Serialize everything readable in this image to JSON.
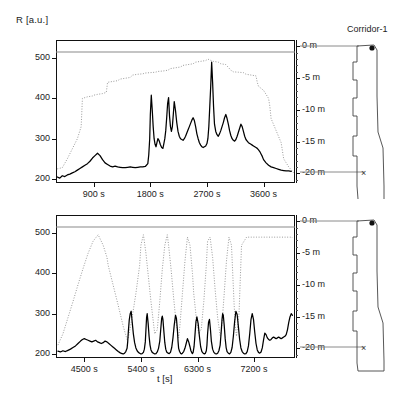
{
  "figure": {
    "y_axis_label": "R [a.u.]",
    "x_axis_label": "t [s]",
    "depth_unit": "m",
    "corridor_title": "Corridor-1",
    "colors": {
      "signal": "#000000",
      "depth_profile": "#9a9a9a",
      "frame": "#111111",
      "guide_line": "#8a8a8a"
    }
  },
  "chart_data": [
    {
      "type": "line",
      "title": "Corridor-1 upper run",
      "xlabel": "t [s]",
      "ylabel": "R [a.u.]",
      "xlim": [
        300,
        4100
      ],
      "ylim": [
        190,
        545
      ],
      "xticks": [
        900,
        1800,
        2700,
        3600
      ],
      "xticklabels": [
        "900 s",
        "1800 s",
        "2700 s",
        "3600 s"
      ],
      "yticks": [
        200,
        300,
        400,
        500
      ],
      "yticklabels": [
        "200",
        "300",
        "400",
        "500"
      ],
      "depth_axis": {
        "ticks": [
          0,
          -5,
          -10,
          -15,
          -20
        ],
        "ticklabels": [
          "0 m",
          "-5 m",
          "-10 m",
          "-15 m",
          "-20 m"
        ],
        "range": [
          -21.5,
          1.0
        ]
      },
      "grid": false,
      "legend": "none",
      "series": [
        {
          "name": "R signal",
          "style": "solid-black",
          "x": [
            320,
            360,
            400,
            440,
            480,
            520,
            560,
            600,
            640,
            680,
            720,
            760,
            800,
            840,
            880,
            920,
            960,
            1000,
            1040,
            1080,
            1120,
            1160,
            1200,
            1240,
            1280,
            1320,
            1360,
            1400,
            1440,
            1480,
            1520,
            1560,
            1600,
            1640,
            1680,
            1720,
            1760,
            1775,
            1790,
            1800,
            1815,
            1830,
            1845,
            1860,
            1875,
            1890,
            1905,
            1920,
            1940,
            1960,
            1980,
            2000,
            2015,
            2030,
            2045,
            2060,
            2075,
            2090,
            2105,
            2120,
            2135,
            2150,
            2165,
            2180,
            2200,
            2220,
            2240,
            2260,
            2280,
            2300,
            2320,
            2340,
            2360,
            2380,
            2400,
            2420,
            2440,
            2460,
            2480,
            2500,
            2520,
            2540,
            2560,
            2580,
            2600,
            2620,
            2640,
            2660,
            2680,
            2700,
            2715,
            2730,
            2745,
            2760,
            2775,
            2790,
            2805,
            2820,
            2840,
            2860,
            2880,
            2900,
            2920,
            2940,
            2960,
            2980,
            3000,
            3020,
            3040,
            3060,
            3080,
            3100,
            3120,
            3140,
            3160,
            3180,
            3200,
            3220,
            3240,
            3260,
            3280,
            3300,
            3320,
            3340,
            3360,
            3380,
            3400,
            3420,
            3440,
            3460,
            3480,
            3500,
            3520,
            3540,
            3560,
            3580,
            3600,
            3640,
            3680,
            3720,
            3760,
            3800,
            3840,
            3880,
            3920,
            3960,
            4000,
            4040,
            4080
          ],
          "y": [
            205,
            202,
            208,
            206,
            210,
            212,
            215,
            218,
            222,
            226,
            230,
            234,
            238,
            244,
            252,
            258,
            264,
            258,
            248,
            240,
            236,
            232,
            230,
            232,
            230,
            229,
            228,
            228,
            229,
            230,
            229,
            228,
            229,
            230,
            230,
            231,
            238,
            260,
            300,
            360,
            408,
            372,
            330,
            300,
            286,
            280,
            290,
            300,
            295,
            285,
            278,
            276,
            288,
            300,
            320,
            352,
            388,
            402,
            356,
            330,
            318,
            330,
            360,
            392,
            370,
            340,
            318,
            306,
            300,
            298,
            296,
            300,
            306,
            314,
            322,
            330,
            338,
            346,
            352,
            345,
            330,
            312,
            300,
            290,
            284,
            280,
            278,
            280,
            282,
            288,
            300,
            330,
            380,
            430,
            490,
            440,
            380,
            336,
            318,
            310,
            306,
            312,
            320,
            330,
            340,
            352,
            360,
            350,
            336,
            320,
            308,
            300,
            296,
            294,
            298,
            306,
            316,
            326,
            336,
            330,
            318,
            306,
            298,
            294,
            290,
            288,
            286,
            284,
            282,
            280,
            278,
            276,
            272,
            268,
            262,
            256,
            248,
            240,
            234,
            230,
            228,
            226,
            224,
            222,
            221,
            220,
            220,
            219
          ]
        },
        {
          "name": "Depth profile",
          "style": "dotted-gray",
          "x": [
            320,
            400,
            480,
            560,
            640,
            700,
            720,
            800,
            880,
            900,
            960,
            1040,
            1100,
            1120,
            1200,
            1280,
            1300,
            1320,
            1400,
            1480,
            1500,
            1520,
            1600,
            1680,
            1700,
            1720,
            1800,
            1880,
            1900,
            1920,
            2000,
            2080,
            2100,
            2120,
            2200,
            2280,
            2300,
            2320,
            2400,
            2480,
            2500,
            2520,
            2600,
            2680,
            2700,
            2720,
            2800,
            2880,
            2900,
            2920,
            3000,
            3080,
            3100,
            3120,
            3200,
            3280,
            3300,
            3320,
            3400,
            3480,
            3500,
            3520,
            3600,
            3680,
            3700,
            3720,
            3800,
            3880,
            3900,
            3920,
            4000,
            4080
          ],
          "y": [
            225,
            228,
            250,
            275,
            300,
            330,
            400,
            404,
            406,
            408,
            410,
            412,
            415,
            440,
            442,
            444,
            446,
            448,
            450,
            452,
            455,
            458,
            460,
            461,
            462,
            463,
            464,
            465,
            466,
            467,
            468,
            470,
            472,
            474,
            476,
            478,
            480,
            482,
            484,
            486,
            488,
            490,
            492,
            494,
            496,
            497,
            492,
            490,
            488,
            486,
            484,
            470,
            468,
            466,
            465,
            464,
            462,
            460,
            458,
            456,
            440,
            430,
            420,
            400,
            380,
            350,
            320,
            290,
            270,
            250,
            230,
            215
          ]
        }
      ]
    },
    {
      "type": "line",
      "title": "Corridor-1 lower run",
      "xlabel": "t [s]",
      "ylabel": "R [a.u.]",
      "xlim": [
        4050,
        7850
      ],
      "ylim": [
        190,
        545
      ],
      "xticks": [
        4500,
        5400,
        6300,
        7200
      ],
      "xticklabels": [
        "4500 s",
        "5400 s",
        "6300 s",
        "7200 s"
      ],
      "yticks": [
        200,
        300,
        400,
        500
      ],
      "yticklabels": [
        "200",
        "300",
        "400",
        "500"
      ],
      "depth_axis": {
        "ticks": [
          0,
          -5,
          -10,
          -15,
          -20
        ],
        "ticklabels": [
          "0 m",
          "-5 m",
          "-10 m",
          "-15 m",
          "-20 m"
        ],
        "range": [
          -21.5,
          1.0
        ]
      },
      "grid": false,
      "legend": "none",
      "series": [
        {
          "name": "R signal",
          "style": "solid-black",
          "x": [
            4080,
            4120,
            4160,
            4200,
            4240,
            4280,
            4320,
            4360,
            4400,
            4440,
            4470,
            4500,
            4530,
            4560,
            4590,
            4620,
            4650,
            4680,
            4710,
            4740,
            4770,
            4800,
            4830,
            4860,
            4890,
            4920,
            4950,
            4980,
            5010,
            5040,
            5060,
            5080,
            5100,
            5120,
            5140,
            5160,
            5180,
            5190,
            5200,
            5215,
            5230,
            5245,
            5260,
            5280,
            5300,
            5320,
            5340,
            5360,
            5380,
            5400,
            5420,
            5440,
            5455,
            5470,
            5480,
            5490,
            5500,
            5515,
            5530,
            5545,
            5560,
            5580,
            5600,
            5620,
            5640,
            5660,
            5680,
            5700,
            5715,
            5730,
            5740,
            5750,
            5765,
            5780,
            5795,
            5810,
            5830,
            5850,
            5870,
            5890,
            5910,
            5930,
            5950,
            5965,
            5980,
            5990,
            6000,
            6015,
            6030,
            6045,
            6060,
            6080,
            6100,
            6120,
            6140,
            6160,
            6180,
            6195,
            6210,
            6220,
            6230,
            6245,
            6260,
            6275,
            6290,
            6310,
            6330,
            6350,
            6370,
            6390,
            6410,
            6425,
            6440,
            6450,
            6460,
            6475,
            6490,
            6505,
            6520,
            6540,
            6560,
            6580,
            6600,
            6620,
            6640,
            6660,
            6675,
            6690,
            6700,
            6710,
            6725,
            6740,
            6755,
            6770,
            6790,
            6810,
            6830,
            6850,
            6870,
            6890,
            6910,
            6930,
            6950,
            6970,
            6990,
            7010,
            7030,
            7050,
            7070,
            7090,
            7110,
            7130,
            7150,
            7170,
            7190,
            7210,
            7230,
            7250,
            7270,
            7290,
            7310,
            7330,
            7350,
            7370,
            7390,
            7410,
            7430,
            7450,
            7470,
            7490,
            7510,
            7530,
            7550,
            7570,
            7590,
            7610,
            7630,
            7650,
            7670,
            7690,
            7710,
            7730,
            7750,
            7770,
            7790,
            7810
          ],
          "y": [
            207,
            205,
            208,
            206,
            209,
            212,
            216,
            220,
            226,
            232,
            236,
            238,
            236,
            234,
            232,
            230,
            232,
            234,
            230,
            228,
            226,
            228,
            232,
            230,
            226,
            222,
            218,
            214,
            210,
            206,
            204,
            202,
            201,
            200,
            202,
            206,
            214,
            230,
            255,
            285,
            300,
            306,
            282,
            250,
            228,
            215,
            208,
            204,
            202,
            200,
            201,
            204,
            212,
            230,
            260,
            290,
            300,
            276,
            244,
            222,
            210,
            204,
            202,
            200,
            201,
            205,
            214,
            232,
            260,
            288,
            294,
            286,
            256,
            228,
            212,
            205,
            202,
            201,
            204,
            216,
            240,
            272,
            296,
            288,
            260,
            232,
            214,
            206,
            202,
            200,
            202,
            206,
            214,
            226,
            238,
            230,
            218,
            208,
            203,
            201,
            204,
            218,
            248,
            280,
            292,
            276,
            244,
            218,
            206,
            202,
            200,
            202,
            208,
            222,
            250,
            278,
            286,
            262,
            232,
            212,
            204,
            201,
            200,
            202,
            208,
            222,
            252,
            286,
            300,
            296,
            270,
            238,
            216,
            206,
            202,
            200,
            204,
            216,
            244,
            280,
            306,
            298,
            268,
            236,
            215,
            206,
            202,
            200,
            201,
            206,
            220,
            250,
            285,
            300,
            286,
            254,
            226,
            210,
            204,
            202,
            205,
            215,
            235,
            252,
            248,
            240,
            236,
            234,
            236,
            240,
            242,
            240,
            238,
            240,
            242,
            240,
            238,
            240,
            242,
            244,
            248,
            260,
            278,
            292,
            300,
            296,
            288,
            282
          ]
        },
        {
          "name": "Depth profile",
          "style": "dotted-gray",
          "x": [
            4080,
            4160,
            4240,
            4320,
            4400,
            4480,
            4560,
            4640,
            4720,
            4800,
            4860,
            4880,
            4960,
            5040,
            5120,
            5180,
            5200,
            5260,
            5320,
            5380,
            5400,
            5440,
            5480,
            5520,
            5560,
            5600,
            5620,
            5660,
            5700,
            5740,
            5780,
            5820,
            5840,
            5880,
            5920,
            5960,
            6000,
            6020,
            6060,
            6100,
            6140,
            6180,
            6220,
            6240,
            6280,
            6320,
            6360,
            6400,
            6440,
            6460,
            6500,
            6540,
            6580,
            6620,
            6660,
            6680,
            6720,
            6760,
            6800,
            6840,
            6860,
            6880,
            6900,
            6920,
            6960,
            7000,
            7080,
            7160,
            7240,
            7320,
            7400,
            7480,
            7560,
            7640,
            7720,
            7800,
            7810
          ],
          "y": [
            222,
            250,
            290,
            330,
            372,
            412,
            450,
            480,
            496,
            470,
            440,
            420,
            370,
            320,
            268,
            236,
            240,
            290,
            350,
            420,
            470,
            496,
            450,
            390,
            330,
            276,
            250,
            260,
            330,
            410,
            470,
            496,
            470,
            410,
            340,
            276,
            240,
            270,
            350,
            430,
            490,
            470,
            400,
            350,
            290,
            250,
            262,
            330,
            420,
            480,
            490,
            440,
            360,
            290,
            246,
            256,
            340,
            430,
            490,
            470,
            400,
            330,
            270,
            244,
            300,
            470,
            490,
            490,
            490,
            490,
            490,
            490,
            490,
            490,
            490,
            490,
            488
          ]
        }
      ]
    }
  ]
}
